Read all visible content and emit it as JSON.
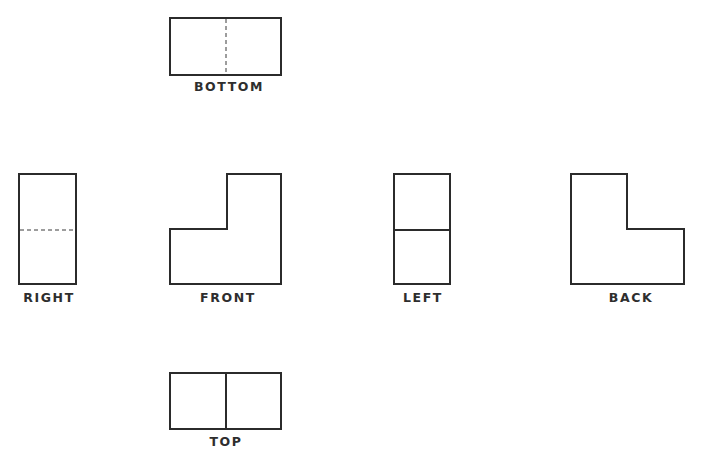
{
  "diagram": {
    "type": "orthographic-projection",
    "stroke_color": "#2b2b2b",
    "label_color": "#2e2e2e",
    "background": "#ffffff"
  },
  "views": {
    "bottom": {
      "label": "BOTTOM",
      "shape": "rectangle",
      "box": {
        "x1": 170,
        "y1": 18,
        "x2": 281,
        "y2": 75
      },
      "inner_line": {
        "type": "hidden-dashed",
        "orientation": "vertical",
        "at": 226
      },
      "label_pos": {
        "x": 229,
        "y": 81
      }
    },
    "right": {
      "label": "RIGHT",
      "shape": "rectangle",
      "box": {
        "x1": 19,
        "y1": 174,
        "x2": 76,
        "y2": 284
      },
      "inner_line": {
        "type": "hidden-dashed",
        "orientation": "horizontal",
        "at": 230
      },
      "label_pos": {
        "x": 49,
        "y": 292
      }
    },
    "front": {
      "label": "FRONT",
      "shape": "L-shape",
      "points": "170,284 170,229 227,229 227,174 281,174 281,284",
      "label_pos": {
        "x": 228,
        "y": 292
      }
    },
    "left": {
      "label": "LEFT",
      "shape": "rectangle",
      "box": {
        "x1": 394,
        "y1": 174,
        "x2": 450,
        "y2": 284
      },
      "inner_line": {
        "type": "visible-solid",
        "orientation": "horizontal",
        "at": 230
      },
      "label_pos": {
        "x": 423,
        "y": 292
      }
    },
    "back": {
      "label": "BACK",
      "shape": "L-shape (mirrored)",
      "points": "571,174 627,174 627,229 684,229 684,284 571,284",
      "label_pos": {
        "x": 631,
        "y": 292
      }
    },
    "top": {
      "label": "TOP",
      "shape": "rectangle",
      "box": {
        "x1": 170,
        "y1": 373,
        "x2": 281,
        "y2": 429
      },
      "inner_line": {
        "type": "visible-solid",
        "orientation": "vertical",
        "at": 226
      },
      "label_pos": {
        "x": 226,
        "y": 436
      }
    }
  }
}
